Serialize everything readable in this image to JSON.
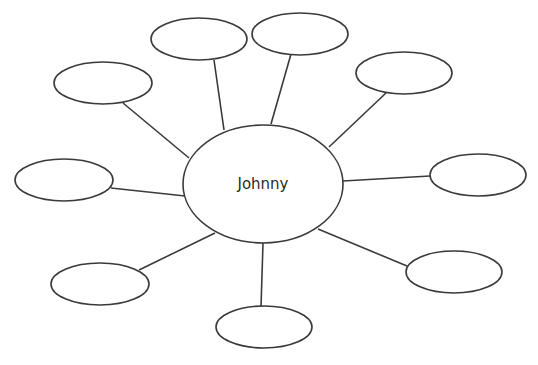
{
  "diagram": {
    "type": "bubble-map",
    "colors": {
      "stroke": "#3a3a3a",
      "fill": "#ffffff",
      "text": "#2a2a2a",
      "background": "#ffffff"
    },
    "center": {
      "label": "Johnny",
      "cx": 263,
      "cy": 184,
      "rx": 80,
      "ry": 59
    },
    "nodes": [
      {
        "id": "top-left",
        "label": "",
        "cx": 103,
        "cy": 83,
        "rx": 49,
        "ry": 21,
        "line": [
          123,
          103,
          189,
          158
        ]
      },
      {
        "id": "top-center-left",
        "label": "",
        "cx": 199,
        "cy": 39,
        "rx": 48,
        "ry": 21,
        "line": [
          214,
          60,
          224,
          130
        ]
      },
      {
        "id": "top-center-right",
        "label": "",
        "cx": 300,
        "cy": 34,
        "rx": 48,
        "ry": 21,
        "line": [
          291,
          54,
          271,
          124
        ]
      },
      {
        "id": "upper-right",
        "label": "",
        "cx": 404,
        "cy": 73,
        "rx": 48,
        "ry": 21,
        "line": [
          386,
          93,
          329,
          147
        ]
      },
      {
        "id": "right",
        "label": "",
        "cx": 478,
        "cy": 175,
        "rx": 48,
        "ry": 21,
        "line": [
          430,
          176,
          343,
          181
        ]
      },
      {
        "id": "left",
        "label": "",
        "cx": 64,
        "cy": 180,
        "rx": 49,
        "ry": 21,
        "line": [
          111,
          188,
          185,
          196
        ]
      },
      {
        "id": "lower-left",
        "label": "",
        "cx": 100,
        "cy": 284,
        "rx": 49,
        "ry": 21,
        "line": [
          139,
          270,
          215,
          233
        ]
      },
      {
        "id": "bottom",
        "label": "",
        "cx": 264,
        "cy": 327,
        "rx": 48,
        "ry": 21,
        "line": [
          263,
          243,
          261,
          307
        ]
      },
      {
        "id": "lower-right",
        "label": "",
        "cx": 454,
        "cy": 272,
        "rx": 48,
        "ry": 21,
        "line": [
          318,
          229,
          407,
          266
        ]
      }
    ]
  }
}
